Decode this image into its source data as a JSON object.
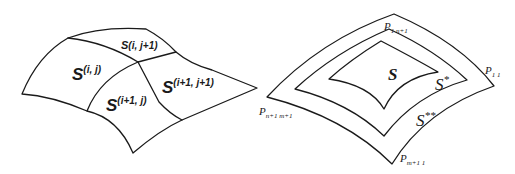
{
  "figure": {
    "left_panel": {
      "description": "Surface patch subdivided into four sub-patches",
      "labels": {
        "s_ij": {
          "base": "S",
          "sup": "(i, j)"
        },
        "s_ij1": {
          "base": "S",
          "sup": "(i, j+1)"
        },
        "s_i1j": {
          "base": "S",
          "sup": "(i+1, j)"
        },
        "s_i1j1": {
          "base": "S",
          "sup": "(i+1, j+1)"
        }
      }
    },
    "right_panel": {
      "description": "Nested surface patches S, S*, S** with corner control points",
      "labels": {
        "s": {
          "base": "S"
        },
        "s_star": {
          "base": "S",
          "sup": "*"
        },
        "s_2star": {
          "base": "S",
          "sup": "**"
        },
        "p_1n1": {
          "base": "P",
          "sub": "1 n+1"
        },
        "p_11": {
          "base": "P",
          "sub": "1 1"
        },
        "p_n1m1": {
          "base": "P",
          "sub": "n+1 m+1"
        },
        "p_m11": {
          "base": "P",
          "sub": "m+1 1"
        }
      }
    },
    "colors": {
      "stroke": "#1a1a1a",
      "background": "#ffffff"
    }
  }
}
